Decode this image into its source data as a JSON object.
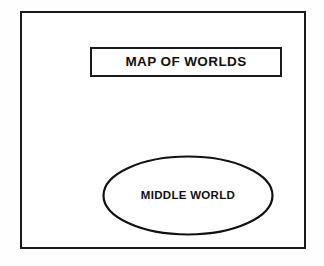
{
  "document": {
    "background_color": "#fefefe",
    "ink_color": "#1a1a1a"
  },
  "frame": {
    "name": "map-frame",
    "border_color": "#1a1a1a",
    "fill_color": "#ffffff"
  },
  "title_box": {
    "label": "MAP OF WORLDS",
    "border_color": "#1a1a1a",
    "fill_color": "#ffffff"
  },
  "nodes": [
    {
      "id": "middle-world",
      "shape": "ellipse",
      "label": "MIDDLE WORLD",
      "stroke_color": "#111111",
      "fill_color": "#ffffff"
    }
  ]
}
